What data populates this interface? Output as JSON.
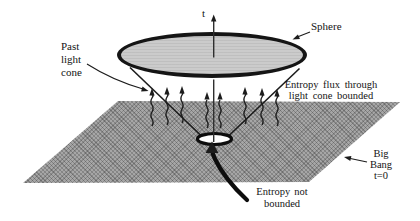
{
  "labels": {
    "time_axis": "t",
    "sphere": "Sphere",
    "past_light_cone": [
      "Past",
      "light",
      "cone"
    ],
    "entropy_flux_bounded": [
      "Entropy flux through",
      "light cone bounded"
    ],
    "big_bang": [
      "Big",
      "Bang",
      "t=0"
    ],
    "entropy_not_bounded": [
      "Entropy not",
      "bounded"
    ]
  },
  "colors": {
    "sphere_fill": "#cbcbcb",
    "plane_fill": "#a6a6a6",
    "line": "#1c1c1c",
    "text": "#141414",
    "background": "#ffffff"
  },
  "flux_arrows": {
    "count": 8
  }
}
